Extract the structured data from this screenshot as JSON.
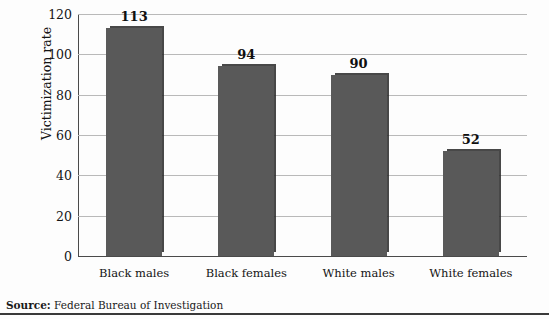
{
  "chart_data": {
    "type": "bar",
    "title": "",
    "subtitle": "",
    "xlabel": "",
    "ylabel": "Victimization rate",
    "categories": [
      "Black males",
      "Black females",
      "White males",
      "White females"
    ],
    "values": [
      113,
      94,
      90,
      52
    ],
    "value_labels": [
      "113",
      "94",
      "90",
      "52"
    ],
    "ylim": [
      0,
      120
    ],
    "yticks": [
      0,
      20,
      40,
      60,
      80,
      100,
      120
    ],
    "ytick_labels": [
      "0",
      "20",
      "40",
      "60",
      "80",
      "100",
      "120"
    ],
    "grid": true,
    "legend": null,
    "legend_position": "none",
    "bar_color": "#595959",
    "gridline_color": "#b9b9b9",
    "axis_color": "#4a4a4a"
  },
  "footer": {
    "source_label": "Source:",
    "source_text": "Federal Bureau of Investigation"
  }
}
